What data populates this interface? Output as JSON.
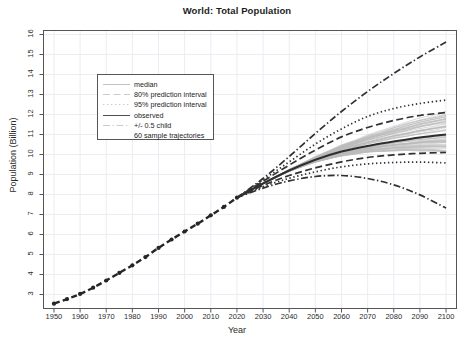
{
  "chart_data": {
    "type": "line",
    "title": "World: Total Population",
    "xlabel": "Year",
    "ylabel": "Population (Billion)",
    "xlim": [
      1946,
      2104
    ],
    "ylim": [
      2.3,
      16.2
    ],
    "grid": true,
    "legend_position": "upper-left-inside",
    "xticks": [
      1950,
      1960,
      1970,
      1980,
      1990,
      2000,
      2010,
      2020,
      2030,
      2040,
      2050,
      2060,
      2070,
      2080,
      2090,
      2100
    ],
    "yticks": [
      3,
      4,
      5,
      6,
      7,
      8,
      9,
      10,
      11,
      12,
      13,
      14,
      15,
      16
    ],
    "legend": [
      {
        "label": "median",
        "style": "solid",
        "width": 1.6,
        "color": "#333333"
      },
      {
        "label": "80% prediction interval",
        "style": "dashed",
        "width": 1.6,
        "color": "#333333"
      },
      {
        "label": "95% prediction interval",
        "style": "dotted",
        "width": 1.6,
        "color": "#333333"
      },
      {
        "label": "observed",
        "style": "solid",
        "width": 2.6,
        "color": "#222222"
      },
      {
        "label": "+/- 0.5 child",
        "style": "dashdot",
        "width": 1.6,
        "color": "#333333"
      },
      {
        "label": "60 sample trajectories",
        "style": "solid",
        "width": 1.0,
        "color": "#b8b8b8"
      }
    ],
    "series": [
      {
        "name": "observed",
        "style": "observed",
        "x": [
          1950,
          1955,
          1960,
          1965,
          1970,
          1975,
          1980,
          1985,
          1990,
          1995,
          2000,
          2005,
          2010,
          2015,
          2020
        ],
        "values": [
          2.54,
          2.77,
          3.03,
          3.34,
          3.7,
          4.08,
          4.46,
          4.87,
          5.33,
          5.75,
          6.15,
          6.54,
          6.96,
          7.38,
          7.84
        ]
      },
      {
        "name": "median",
        "style": "median",
        "x": [
          2020,
          2030,
          2040,
          2050,
          2060,
          2070,
          2080,
          2090,
          2100
        ],
        "values": [
          7.84,
          8.55,
          9.2,
          9.74,
          10.15,
          10.43,
          10.65,
          10.85,
          11.0
        ]
      },
      {
        "name": "80% prediction interval upper",
        "style": "dashed",
        "x": [
          2020,
          2030,
          2040,
          2050,
          2060,
          2070,
          2080,
          2090,
          2100
        ],
        "values": [
          7.84,
          8.66,
          9.47,
          10.22,
          10.88,
          11.35,
          11.7,
          11.95,
          12.1
        ]
      },
      {
        "name": "80% prediction interval lower",
        "style": "dashed",
        "x": [
          2020,
          2030,
          2040,
          2050,
          2060,
          2070,
          2080,
          2090,
          2100
        ],
        "values": [
          7.84,
          8.45,
          8.95,
          9.33,
          9.63,
          9.85,
          9.98,
          10.06,
          10.1
        ]
      },
      {
        "name": "95% prediction interval upper",
        "style": "dotted",
        "x": [
          2020,
          2030,
          2040,
          2050,
          2060,
          2070,
          2080,
          2090,
          2100
        ],
        "values": [
          7.84,
          8.73,
          9.63,
          10.52,
          11.28,
          11.9,
          12.3,
          12.55,
          12.72
        ]
      },
      {
        "name": "95% prediction interval lower",
        "style": "dotted",
        "x": [
          2020,
          2030,
          2040,
          2050,
          2060,
          2070,
          2080,
          2090,
          2100
        ],
        "values": [
          7.84,
          8.39,
          8.81,
          9.13,
          9.38,
          9.53,
          9.6,
          9.62,
          9.58
        ]
      },
      {
        "name": "+0.5 child",
        "style": "dashdot",
        "x": [
          2020,
          2030,
          2040,
          2050,
          2060,
          2070,
          2080,
          2090,
          2100
        ],
        "values": [
          7.84,
          8.8,
          9.9,
          11.05,
          12.15,
          13.15,
          14.05,
          14.88,
          15.62
        ]
      },
      {
        "name": "-0.5 child",
        "style": "dashdot",
        "x": [
          2020,
          2030,
          2040,
          2050,
          2060,
          2070,
          2080,
          2090,
          2100
        ],
        "values": [
          7.84,
          8.32,
          8.68,
          8.9,
          8.95,
          8.8,
          8.48,
          7.98,
          7.32
        ]
      }
    ],
    "sample_trajectories": {
      "count": 60,
      "color": "#b9b9b9",
      "endpoint_range_2100": [
        9.9,
        11.9
      ]
    }
  }
}
